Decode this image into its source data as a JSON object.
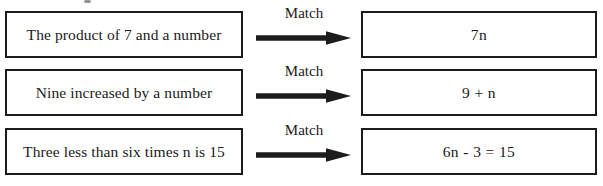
{
  "page": {
    "background_color": "#ffffff",
    "ink_color": "#1c1c1c"
  },
  "connector": {
    "label": "Match",
    "arrow_icon": "arrow-right-icon"
  },
  "rows": [
    {
      "phrase": "The product of 7 and a number",
      "match_label": "Match",
      "expression": "7n"
    },
    {
      "phrase": "Nine increased by a number",
      "match_label": "Match",
      "expression": "9 + n"
    },
    {
      "phrase": "Three less than six times n is 15",
      "match_label": "Match",
      "expression": "6n - 3 = 15"
    }
  ]
}
